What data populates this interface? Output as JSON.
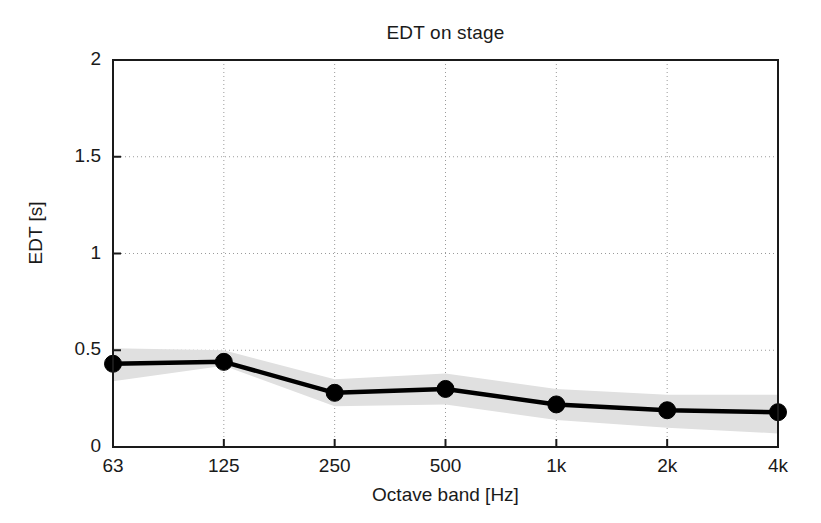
{
  "chart_data": {
    "type": "line",
    "title": "EDT on stage",
    "xlabel": "Octave band [Hz]",
    "ylabel": "EDT [s]",
    "categories": [
      "63",
      "125",
      "250",
      "500",
      "1k",
      "2k",
      "4k"
    ],
    "x_tick_labels": [
      "63",
      "125",
      "250",
      "500",
      "1k",
      "2k",
      "4k"
    ],
    "y_tick_labels": [
      "0",
      "0.5",
      "1",
      "1.5",
      "2"
    ],
    "y_tick_values": [
      0,
      0.5,
      1,
      1.5,
      2
    ],
    "ylim": [
      0,
      2
    ],
    "grid": true,
    "grid_style": "dotted",
    "legend": null,
    "series": [
      {
        "name": "EDT mean",
        "marker": "filled-circle",
        "color": "#000000",
        "values": [
          0.43,
          0.44,
          0.28,
          0.3,
          0.22,
          0.19,
          0.18
        ]
      }
    ],
    "band": {
      "name": "standard deviation",
      "color": "#e0e0e0",
      "upper": [
        0.51,
        0.5,
        0.35,
        0.38,
        0.3,
        0.27,
        0.27
      ],
      "lower": [
        0.34,
        0.42,
        0.21,
        0.22,
        0.14,
        0.1,
        0.07
      ]
    },
    "colors": {
      "line": "#000000",
      "marker": "#000000",
      "band": "#e0e0e0",
      "axis": "#1a1a1a",
      "grid": "#9a9a9a",
      "background": "#ffffff"
    }
  },
  "axes": {
    "x_ticks": [
      "63",
      "125",
      "250",
      "500",
      "1k",
      "2k",
      "4k"
    ],
    "y_ticks": [
      "0",
      "0.5",
      "1",
      "1.5",
      "2"
    ]
  }
}
